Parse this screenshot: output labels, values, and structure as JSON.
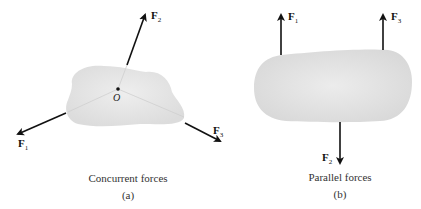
{
  "panels": [
    {
      "id": "a",
      "caption": "Concurrent forces",
      "sublabel": "(a)",
      "point_label": "O",
      "forces": [
        {
          "name": "F",
          "sub": "1"
        },
        {
          "name": "F",
          "sub": "2"
        },
        {
          "name": "F",
          "sub": "3"
        }
      ]
    },
    {
      "id": "b",
      "caption": "Parallel forces",
      "sublabel": "(b)",
      "forces": [
        {
          "name": "F",
          "sub": "1"
        },
        {
          "name": "F",
          "sub": "2"
        },
        {
          "name": "F",
          "sub": "3"
        }
      ]
    }
  ],
  "colors": {
    "body_fill": "#e6e6e6",
    "arrow": "#111111",
    "dashed_line": "#cfcfcf"
  }
}
